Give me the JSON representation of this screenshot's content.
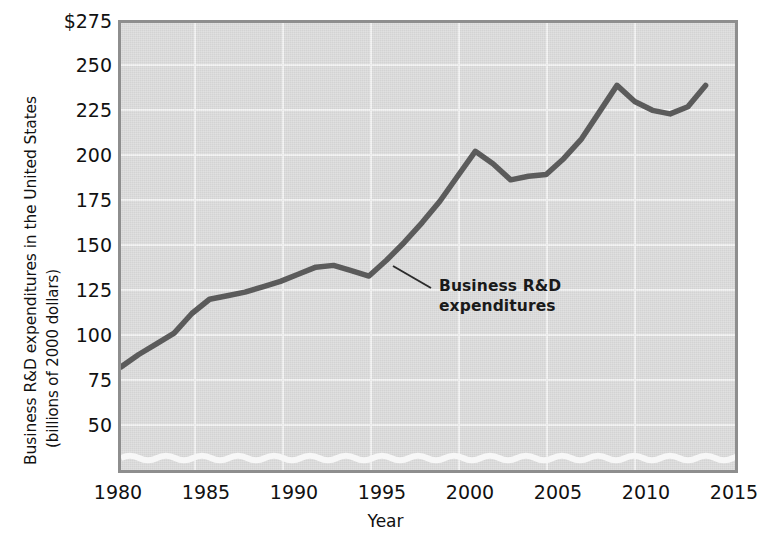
{
  "figure": {
    "background_color": "#ffffff",
    "plot_background_color": "#dbdbdb",
    "gridline_color": "#f2f2f2",
    "line_color": "#5b5b5b",
    "axis_color": "#8e8e8e",
    "text_color": "#111111"
  },
  "axes": {
    "y_title_line1": "Business R&D expenditures in the United States",
    "y_title_line2": "(billions of 2000 dollars)",
    "x_title": "Year",
    "y_ticks": [
      "$275",
      "250",
      "225",
      "200",
      "175",
      "150",
      "125",
      "100",
      "75",
      "50"
    ],
    "x_ticks": [
      "1980",
      "1985",
      "1990",
      "1995",
      "2000",
      "2005",
      "2010",
      "2015"
    ],
    "axis_break_note": "wavy break between 0 and 50 on the value axis"
  },
  "annotation": {
    "line1": "Business R&D",
    "line2": "expenditures"
  },
  "chart_data": {
    "type": "line",
    "title": "",
    "xlabel": "Year",
    "ylabel": "Business R&D expenditures in the United States (billions of 2000 dollars)",
    "xlim": [
      1980,
      2015
    ],
    "ylim": [
      50,
      275
    ],
    "y_tick_values": [
      275,
      250,
      225,
      200,
      175,
      150,
      125,
      100,
      75,
      50
    ],
    "x_tick_values": [
      1980,
      1985,
      1990,
      1995,
      2000,
      2005,
      2010,
      2015
    ],
    "grid": true,
    "legend": "none",
    "y_axis_broken_below": 50,
    "series": [
      {
        "name": "Business R&D expenditures",
        "color": "#5b5b5b",
        "x": [
          1980,
          1981,
          1982,
          1983,
          1984,
          1985,
          1986,
          1987,
          1988,
          1989,
          1990,
          1991,
          1992,
          1993,
          1994,
          1995,
          1996,
          1997,
          1998,
          1999,
          2000,
          2001,
          2002,
          2003,
          2004,
          2005,
          2006,
          2007,
          2008,
          2009,
          2010,
          2011,
          2012,
          2013
        ],
        "values": [
          82,
          89,
          95,
          101,
          112,
          120,
          122,
          124,
          127,
          130,
          134,
          138,
          139,
          136,
          133,
          142,
          152,
          163,
          175,
          189,
          203,
          196,
          187,
          189,
          190,
          199,
          210,
          225,
          240,
          231,
          226,
          224,
          228,
          240
        ]
      }
    ]
  }
}
